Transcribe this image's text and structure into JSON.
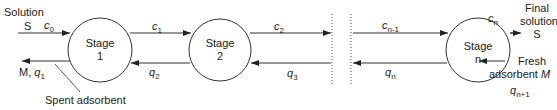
{
  "diagram": {
    "type": "countercurrent multistage adsorption",
    "stages": [
      {
        "title": "Stage",
        "number": "1"
      },
      {
        "title": "Stage",
        "number": "2"
      },
      {
        "title": "Stage",
        "number": "n"
      }
    ],
    "inlet": {
      "label_line1": "Solution",
      "label_line2": "S",
      "conc_symbol": "c",
      "conc_sub": "0"
    },
    "outlet_solid": {
      "label": "M,",
      "conc_symbol": "q",
      "conc_sub": "1",
      "note": "Spent adsorbent"
    },
    "streams_top": [
      {
        "symbol": "c",
        "sub": "1"
      },
      {
        "symbol": "c",
        "sub": "2"
      },
      {
        "symbol": "c",
        "sub": "n-1"
      },
      {
        "symbol": "c",
        "sub": "n"
      }
    ],
    "streams_bottom": [
      {
        "symbol": "q",
        "sub": "2"
      },
      {
        "symbol": "q",
        "sub": "3"
      },
      {
        "symbol": "q",
        "sub": "n"
      }
    ],
    "final_solution": {
      "line1": "Final",
      "line2": "solution",
      "line3": "S"
    },
    "fresh_adsorbent": {
      "line1": "Fresh",
      "line2": "adsorbent",
      "symbol": "M",
      "conc_symbol": "q",
      "conc_sub": "n+1"
    },
    "colors": {
      "line": "#333333",
      "dotted": "#555555"
    }
  }
}
